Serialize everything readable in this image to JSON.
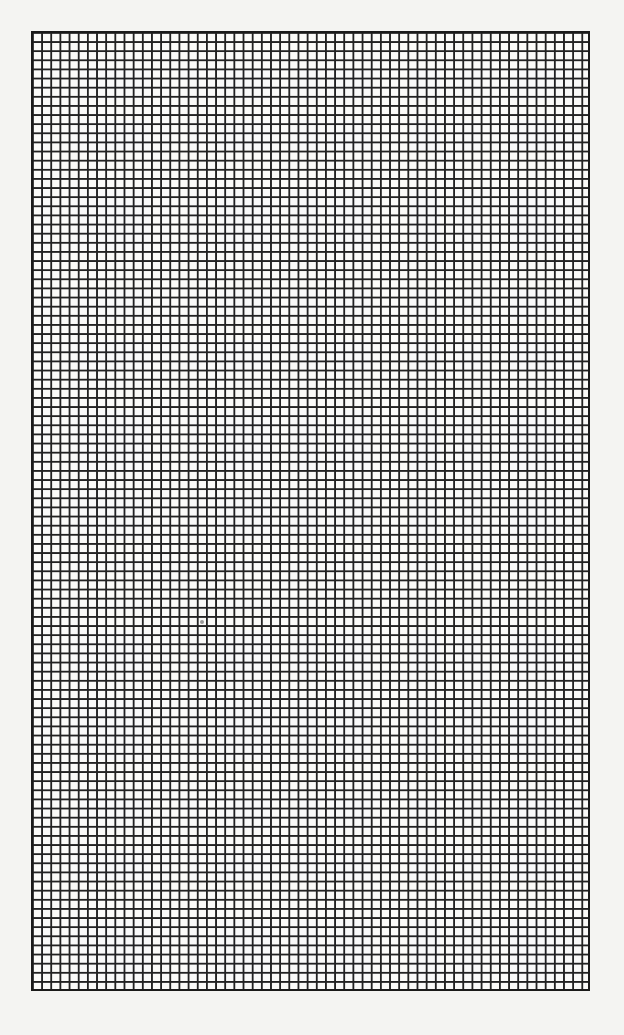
{
  "page": {
    "type": "graph-paper",
    "background_color": "#f4f4f2",
    "line_color": "#222222"
  },
  "grid": {
    "columns": 61,
    "rows": 105,
    "left": 31,
    "top": 31,
    "width": 559,
    "height": 960
  },
  "caption": ""
}
